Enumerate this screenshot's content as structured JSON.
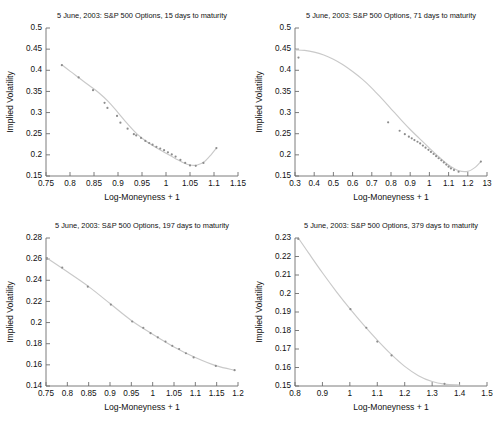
{
  "figure": {
    "background": "#ffffff",
    "curve_color": "#c9c9c9",
    "marker_color": "#8d8d8d",
    "axis_color": "#6e6e6e"
  },
  "chart_data": [
    {
      "id": "panel-15-days",
      "type": "scatter",
      "title": "5 June, 2003: S&P 500 Options, 15 days to maturity",
      "xlabel": "Log-Moneyness + 1",
      "ylabel": "Implied Volatility",
      "xlim": [
        0.75,
        1.15
      ],
      "ylim": [
        0.15,
        0.5
      ],
      "grid": false,
      "legend": null,
      "xticks": [
        "0.75",
        "0.8",
        "0.85",
        "0.9",
        "0.95",
        "1",
        "1.05",
        "1.1",
        "1.15"
      ],
      "xtick_values": [
        0.75,
        0.8,
        0.85,
        0.9,
        0.95,
        1.0,
        1.05,
        1.1,
        1.15
      ],
      "yticks": [
        "0.5",
        "0.45",
        "0.4",
        "0.35",
        "0.3",
        "0.25",
        "0.2",
        "0.15"
      ],
      "ytick_values": [
        0.5,
        0.45,
        0.4,
        0.35,
        0.3,
        0.25,
        0.2,
        0.15
      ],
      "points": {
        "x": [
          0.783,
          0.818,
          0.848,
          0.872,
          0.878,
          0.898,
          0.905,
          0.92,
          0.933,
          0.938,
          0.948,
          0.957,
          0.965,
          0.972,
          0.98,
          0.988,
          0.996,
          1.004,
          1.012,
          1.02,
          1.03,
          1.04,
          1.05,
          1.062,
          1.078,
          1.105
        ],
        "y": [
          0.412,
          0.383,
          0.353,
          0.323,
          0.311,
          0.292,
          0.276,
          0.262,
          0.249,
          0.246,
          0.24,
          0.233,
          0.228,
          0.224,
          0.219,
          0.215,
          0.211,
          0.206,
          0.201,
          0.196,
          0.188,
          0.181,
          0.175,
          0.174,
          0.181,
          0.216
        ]
      },
      "fit_curve": {
        "x": [
          0.783,
          0.8,
          0.82,
          0.84,
          0.86,
          0.88,
          0.9,
          0.92,
          0.94,
          0.96,
          0.98,
          1.0,
          1.02,
          1.035,
          1.05,
          1.065,
          1.08,
          1.095,
          1.105
        ],
        "y": [
          0.413,
          0.398,
          0.381,
          0.364,
          0.347,
          0.326,
          0.3,
          0.273,
          0.249,
          0.231,
          0.217,
          0.204,
          0.191,
          0.182,
          0.176,
          0.176,
          0.184,
          0.202,
          0.216
        ]
      }
    },
    {
      "id": "panel-71-days",
      "type": "scatter",
      "title": "5 June, 2003: S&P 500 Options, 71 days to maturity",
      "xlabel": "Log-Moneyness + 1",
      "ylabel": "Implied Volatility",
      "xlim": [
        0.3,
        1.3
      ],
      "ylim": [
        0.15,
        0.5
      ],
      "grid": false,
      "legend": null,
      "xticks": [
        "0.3",
        "0.4",
        "0.5",
        "0.6",
        "0.7",
        "0.8",
        "0.9",
        "1",
        "1.1",
        "1.2",
        "13"
      ],
      "xtick_values": [
        0.3,
        0.4,
        0.5,
        0.6,
        0.7,
        0.8,
        0.9,
        1.0,
        1.1,
        1.2,
        1.3
      ],
      "yticks": [
        "0.5",
        "0.45",
        "0.4",
        "0.35",
        "0.3",
        "0.25",
        "0.2",
        "0.15"
      ],
      "ytick_values": [
        0.5,
        0.45,
        0.4,
        0.35,
        0.3,
        0.25,
        0.2,
        0.15
      ],
      "points": {
        "x": [
          0.318,
          0.785,
          0.845,
          0.872,
          0.893,
          0.908,
          0.922,
          0.938,
          0.952,
          0.966,
          0.98,
          0.995,
          1.008,
          1.022,
          1.035,
          1.048,
          1.062,
          1.075,
          1.088,
          1.1,
          1.112,
          1.128,
          1.152,
          1.268
        ],
        "y": [
          0.43,
          0.277,
          0.257,
          0.249,
          0.243,
          0.239,
          0.235,
          0.231,
          0.227,
          0.222,
          0.217,
          0.212,
          0.207,
          0.202,
          0.197,
          0.192,
          0.187,
          0.182,
          0.177,
          0.172,
          0.168,
          0.164,
          0.16,
          0.184
        ]
      },
      "fit_curve": {
        "x": [
          0.3,
          0.35,
          0.4,
          0.45,
          0.5,
          0.55,
          0.6,
          0.65,
          0.7,
          0.75,
          0.8,
          0.85,
          0.9,
          0.95,
          1.0,
          1.05,
          1.1,
          1.15,
          1.2,
          1.24,
          1.268
        ],
        "y": [
          0.448,
          0.447,
          0.443,
          0.436,
          0.426,
          0.413,
          0.397,
          0.379,
          0.358,
          0.334,
          0.309,
          0.284,
          0.26,
          0.238,
          0.216,
          0.195,
          0.176,
          0.163,
          0.161,
          0.171,
          0.184
        ]
      }
    },
    {
      "id": "panel-197-days",
      "type": "scatter",
      "title": "5 June, 2003: S&P 500 Options, 197 days to maturity",
      "xlabel": "Log-Moneyness + 1",
      "ylabel": "Implied Volatility",
      "xlim": [
        0.75,
        1.2
      ],
      "ylim": [
        0.14,
        0.28
      ],
      "grid": false,
      "legend": null,
      "xticks": [
        "0.75",
        "0.8",
        "0.85",
        "0.9",
        "0.95",
        "1",
        "1.05",
        "1.1",
        "1.15",
        "1.2"
      ],
      "xtick_values": [
        0.75,
        0.8,
        0.85,
        0.9,
        0.95,
        1.0,
        1.05,
        1.1,
        1.15,
        1.2
      ],
      "yticks": [
        "0.28",
        "0.26",
        "0.24",
        "0.22",
        "0.2",
        "0.18",
        "0.16",
        "0.14"
      ],
      "ytick_values": [
        0.28,
        0.26,
        0.24,
        0.22,
        0.2,
        0.18,
        0.16,
        0.14
      ],
      "points": {
        "x": [
          0.752,
          0.788,
          0.848,
          0.902,
          0.952,
          0.978,
          0.995,
          1.012,
          1.03,
          1.046,
          1.062,
          1.078,
          1.096,
          1.148,
          1.192
        ],
        "y": [
          0.261,
          0.252,
          0.234,
          0.217,
          0.201,
          0.195,
          0.19,
          0.186,
          0.182,
          0.178,
          0.175,
          0.171,
          0.167,
          0.159,
          0.155
        ]
      },
      "fit_curve": {
        "x": [
          0.752,
          0.8,
          0.85,
          0.9,
          0.95,
          1.0,
          1.05,
          1.1,
          1.15,
          1.192
        ],
        "y": [
          0.261,
          0.248,
          0.234,
          0.218,
          0.202,
          0.189,
          0.177,
          0.167,
          0.159,
          0.155
        ]
      }
    },
    {
      "id": "panel-379-days",
      "type": "scatter",
      "title": "5 June, 2003: S&P 500 Options, 379 days to maturity",
      "xlabel": "Log-Moneyness + 1",
      "ylabel": "Implied Volatility",
      "xlim": [
        0.8,
        1.5
      ],
      "ylim": [
        0.15,
        0.23
      ],
      "grid": false,
      "legend": null,
      "xticks": [
        "0.8",
        "0.9",
        "1",
        "1.1",
        "1.2",
        "1.3",
        "1.4",
        "1.5"
      ],
      "xtick_values": [
        0.8,
        0.9,
        1.0,
        1.1,
        1.2,
        1.3,
        1.4,
        1.5
      ],
      "yticks": [
        "0.23",
        "0.22",
        "0.21",
        "0.2",
        "0.19",
        "0.18",
        "0.17",
        "0.16",
        "0.15"
      ],
      "ytick_values": [
        0.23,
        0.22,
        0.21,
        0.2,
        0.19,
        0.18,
        0.17,
        0.16,
        0.15
      ],
      "points": {
        "x": [
          0.812,
          1.002,
          1.06,
          1.1,
          1.152,
          1.345
        ],
        "y": [
          0.2295,
          0.1915,
          0.1815,
          0.174,
          0.1665,
          0.1512
        ]
      },
      "fit_curve": {
        "x": [
          0.812,
          0.85,
          0.9,
          0.95,
          1.0,
          1.05,
          1.1,
          1.15,
          1.2,
          1.25,
          1.3,
          1.345,
          1.4
        ],
        "y": [
          0.23,
          0.2218,
          0.2112,
          0.2012,
          0.1918,
          0.183,
          0.1748,
          0.1672,
          0.1606,
          0.1556,
          0.1524,
          0.151,
          0.1505
        ]
      }
    }
  ]
}
